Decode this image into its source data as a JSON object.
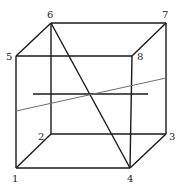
{
  "figure": {
    "type": "cube-diagram",
    "vertices": [
      {
        "id": "1",
        "label": "1",
        "x": 16,
        "y": 168,
        "lx": 12,
        "ly": 182
      },
      {
        "id": "2",
        "label": "2",
        "x": 51,
        "y": 134,
        "lx": 38,
        "ly": 140
      },
      {
        "id": "3",
        "label": "3",
        "x": 166,
        "y": 134,
        "lx": 169,
        "ly": 140
      },
      {
        "id": "4",
        "label": "4",
        "x": 130,
        "y": 168,
        "lx": 127,
        "ly": 182
      },
      {
        "id": "5",
        "label": "5",
        "x": 16,
        "y": 56,
        "lx": 6,
        "ly": 60
      },
      {
        "id": "6",
        "label": "6",
        "x": 51,
        "y": 23,
        "lx": 47,
        "ly": 18
      },
      {
        "id": "7",
        "label": "7",
        "x": 166,
        "y": 23,
        "lx": 162,
        "ly": 18
      },
      {
        "id": "8",
        "label": "8",
        "x": 132,
        "y": 56,
        "lx": 137,
        "ly": 60
      }
    ],
    "edges": [
      [
        "1",
        "4"
      ],
      [
        "1",
        "5"
      ],
      [
        "1",
        "2"
      ],
      [
        "2",
        "3"
      ],
      [
        "2",
        "6"
      ],
      [
        "3",
        "4"
      ],
      [
        "3",
        "7"
      ],
      [
        "4",
        "8"
      ],
      [
        "5",
        "6"
      ],
      [
        "5",
        "8"
      ],
      [
        "6",
        "7"
      ],
      [
        "7",
        "8"
      ]
    ],
    "diagonal": [
      "6",
      "4"
    ],
    "horizontal_segment": {
      "x1": 33,
      "y1": 94,
      "x2": 148,
      "y2": 94
    },
    "slanted_line": {
      "x1": 16,
      "y1": 111,
      "x2": 166,
      "y2": 78,
      "color": "#6e6e6e"
    }
  }
}
